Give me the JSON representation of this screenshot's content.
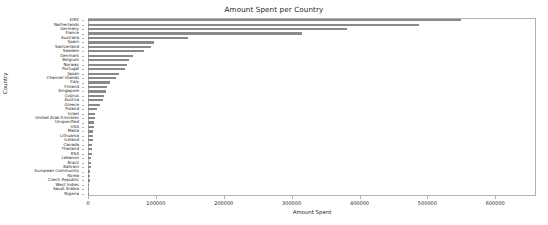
{
  "chart_data": {
    "type": "bar",
    "orientation": "horizontal",
    "title": "Amount Spent per Country",
    "xlabel": "Amount Spent",
    "ylabel": "Country",
    "xlim": [
      0,
      660000
    ],
    "xticks": [
      0,
      100000,
      200000,
      300000,
      400000,
      500000,
      600000
    ],
    "xticklabels": [
      "0",
      "100000",
      "200000",
      "300000",
      "400000",
      "500000",
      "600000"
    ],
    "grid": false,
    "legend": null,
    "bar_color": "#8a8a8a",
    "categories": [
      "EIRE",
      "Netherlands",
      "Germany",
      "France",
      "Australia",
      "Spain",
      "Switzerland",
      "Sweden",
      "Denmark",
      "Belgium",
      "Norway",
      "Portugal",
      "Japan",
      "Channel Islands",
      "Italy",
      "Finland",
      "Singapore",
      "Cyprus",
      "Austria",
      "Greece",
      "Poland",
      "Israel",
      "United Arab Emirates",
      "Unspecified",
      "USA",
      "Malta",
      "Lithuania",
      "Iceland",
      "Canada",
      "Thailand",
      "RSA",
      "Lebanon",
      "Brazil",
      "Bahrain",
      "European Community",
      "Korea",
      "Czech Republic",
      "West Indies",
      "Saudi Arabia",
      "Nigeria"
    ],
    "values": [
      550000,
      487000,
      381000,
      316000,
      148000,
      97000,
      93000,
      82000,
      67000,
      61000,
      58000,
      55000,
      45000,
      41000,
      32000,
      28000,
      26000,
      23000,
      22000,
      18000,
      13000,
      11000,
      10000,
      9000,
      8500,
      8000,
      7500,
      7000,
      6500,
      6000,
      5500,
      5000,
      4500,
      4000,
      3500,
      3000,
      2500,
      2000,
      1500,
      1000
    ]
  }
}
